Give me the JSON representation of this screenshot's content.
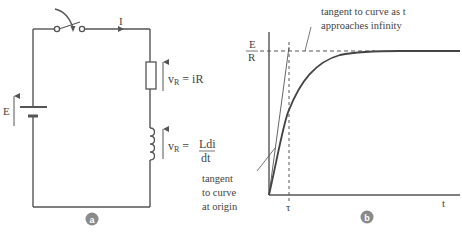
{
  "colors": {
    "line": "#555555",
    "text": "#444444",
    "badge": "#8a8a8a",
    "background": "#ffffff"
  },
  "panel_a": {
    "badge": "a",
    "current_label": "I",
    "source_label": "E",
    "resistor_voltage": {
      "symbol": "v",
      "subscript": "R",
      "equals": "= iR"
    },
    "inductor_voltage": {
      "symbol": "v",
      "subscript": "R",
      "equals": "=",
      "numerator": "Ldi",
      "denominator": "dt"
    }
  },
  "panel_b": {
    "badge": "b",
    "y_level_numerator": "E",
    "y_level_denominator": "R",
    "x_axis_label": "t",
    "tau_label": "τ",
    "annotation_top_line1": "tangent to curve as t",
    "annotation_top_line2": "approaches infinity",
    "annotation_origin_line1": "tangent",
    "annotation_origin_line2": "to curve",
    "annotation_origin_line3": "at origin"
  }
}
